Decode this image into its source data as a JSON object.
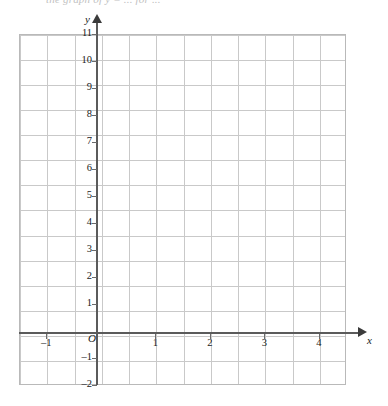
{
  "page": {
    "caption_remnant": "the graph of y = ... for ..."
  },
  "chart_data": {
    "type": "grid",
    "title": "",
    "xlabel": "x",
    "ylabel": "y",
    "origin_label": "O",
    "xlim": [
      -1.5,
      4.5
    ],
    "ylim": [
      -2.0,
      11.0
    ],
    "x_ticks": [
      -1,
      1,
      2,
      3,
      4
    ],
    "x_tick_labels": [
      "–1",
      "1",
      "2",
      "3",
      "4"
    ],
    "y_ticks": [
      11,
      10,
      9,
      8,
      7,
      6,
      5,
      4,
      3,
      2,
      1,
      -1,
      -2
    ],
    "y_tick_labels": [
      "11",
      "10",
      "9",
      "8",
      "7",
      "6",
      "5",
      "4",
      "3",
      "2",
      "1",
      "–1",
      "–2"
    ],
    "grid": true,
    "grid_minor_step_x": 0.5,
    "grid_minor_step_y": 1.0,
    "grid_columns": 12,
    "grid_rows": 14,
    "legend": null,
    "series": [],
    "annotations": [],
    "colors": {
      "grid_line": "#c9c9c9",
      "grid_border": "#b9b9b9",
      "axis": "#5b5b5b",
      "axis_arrow": "#3b3b3b",
      "label_text": "#1a1a1a",
      "background": "#ffffff"
    }
  }
}
